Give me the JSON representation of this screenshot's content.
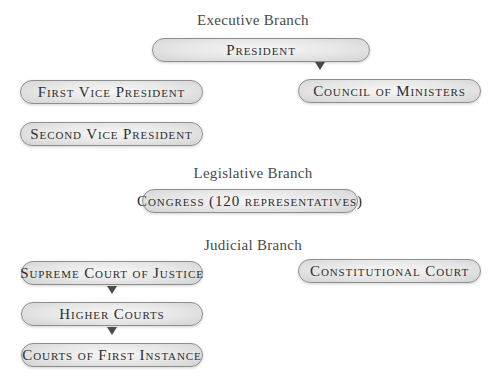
{
  "diagram": {
    "executive": {
      "heading": "Executive Branch",
      "president": "President",
      "first_vice_president": "First Vice President",
      "second_vice_president": "Second Vice President",
      "council_of_ministers": "Council of Ministers"
    },
    "legislative": {
      "heading": "Legislative Branch",
      "congress": "Congress (120 representatives)"
    },
    "judicial": {
      "heading": "Judicial Branch",
      "supreme_court": "Supreme Court of Justice",
      "higher_courts": "Higher Courts",
      "courts_first_instance": "Courts of First Instance",
      "constitutional_court": "Constitutional Court"
    },
    "colors": {
      "pill_border": "#8e8e8e",
      "pill_fill": "#e6e6e6",
      "arrow": "#4a4a4a",
      "text": "#2e2e2e"
    }
  }
}
